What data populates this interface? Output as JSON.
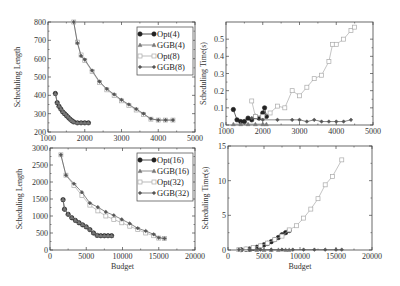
{
  "chart_data": [
    {
      "type": "line",
      "title": "",
      "xlabel": "",
      "ylabel": "Scheduling Length",
      "xlim": [
        1000,
        5000
      ],
      "ylim": [
        200,
        800
      ],
      "xticks": [
        1000,
        2000,
        3000,
        4000,
        5000
      ],
      "yticks": [
        200,
        300,
        400,
        500,
        600,
        700,
        800
      ],
      "legend": [
        "Opt(4)",
        "GGB(4)",
        "Opt(8)",
        "GGB(8)"
      ],
      "legend_position": "upper right",
      "series": [
        {
          "name": "Opt(4)",
          "x": [
            1200,
            1250,
            1300,
            1350,
            1400,
            1450,
            1500,
            1550,
            1600,
            1650,
            1700,
            1800,
            1900,
            2000,
            2100
          ],
          "y": [
            410,
            360,
            340,
            325,
            310,
            300,
            290,
            280,
            270,
            262,
            255,
            250,
            250,
            250,
            250
          ]
        },
        {
          "name": "GGB(4)",
          "x": [
            1200,
            1250,
            1300,
            1350,
            1400,
            1450,
            1500,
            1550,
            1600,
            1650,
            1700,
            1800,
            1900,
            2000,
            2100
          ],
          "y": [
            410,
            362,
            342,
            327,
            312,
            302,
            292,
            282,
            272,
            263,
            256,
            251,
            251,
            251,
            251
          ]
        },
        {
          "name": "Opt(8)",
          "x": [
            1700,
            1800,
            1900,
            2000,
            2200,
            2400,
            2600,
            2800,
            3000,
            3200,
            3400,
            3600,
            3800,
            4000,
            4200,
            4400
          ],
          "y": [
            800,
            690,
            620,
            590,
            530,
            470,
            430,
            400,
            370,
            345,
            320,
            295,
            270,
            265,
            265,
            265
          ]
        },
        {
          "name": "GGB(8)",
          "x": [
            1700,
            1800,
            1900,
            2000,
            2200,
            2400,
            2600,
            2800,
            3000,
            3200,
            3400,
            3600,
            3800,
            4000,
            4200,
            4400
          ],
          "y": [
            800,
            685,
            615,
            595,
            535,
            475,
            435,
            405,
            375,
            350,
            325,
            300,
            272,
            265,
            265,
            265
          ]
        }
      ]
    },
    {
      "type": "line",
      "title": "",
      "xlabel": "",
      "ylabel": "Scheduling Time(s)",
      "xlim": [
        1000,
        5000
      ],
      "ylim": [
        0,
        0.6
      ],
      "xticks": [
        1000,
        2000,
        3000,
        4000,
        5000
      ],
      "yticks": [
        0,
        0.1,
        0.2,
        0.3,
        0.4,
        0.5
      ],
      "series": [
        {
          "name": "Opt(4)",
          "x": [
            1200,
            1300,
            1400,
            1500,
            1600,
            1700,
            1800,
            1900,
            2000,
            2050,
            2100
          ],
          "y": [
            0.09,
            0.03,
            0.02,
            0.02,
            0.04,
            0.03,
            0.05,
            0.04,
            0.07,
            0.1,
            0.05
          ]
        },
        {
          "name": "GGB(4)",
          "x": [
            1200,
            1400,
            1600,
            1800,
            2000,
            2100
          ],
          "y": [
            0.005,
            0.005,
            0.005,
            0.005,
            0.005,
            0.005
          ]
        },
        {
          "name": "Opt(8)",
          "x": [
            1700,
            1800,
            2000,
            2200,
            2400,
            2600,
            2800,
            3000,
            3200,
            3400,
            3600,
            3800,
            3900,
            4000,
            4200,
            4400,
            4500
          ],
          "y": [
            0.14,
            0.05,
            0.05,
            0.07,
            0.11,
            0.1,
            0.2,
            0.17,
            0.22,
            0.27,
            0.29,
            0.37,
            0.47,
            0.47,
            0.5,
            0.55,
            0.57
          ]
        },
        {
          "name": "GGB(8)",
          "x": [
            1700,
            2000,
            2400,
            2800,
            3000,
            3200,
            3400,
            3600,
            3800,
            4000,
            4200,
            4400
          ],
          "y": [
            0.04,
            0.03,
            0.03,
            0.03,
            0.03,
            0.02,
            0.03,
            0.02,
            0.02,
            0.02,
            0.02,
            0.03
          ]
        }
      ]
    },
    {
      "type": "line",
      "title": "",
      "xlabel": "Budget",
      "ylabel": "Scheduling Length",
      "xlim": [
        0,
        20000
      ],
      "ylim": [
        0,
        3000
      ],
      "xticks": [
        0,
        5000,
        10000,
        15000,
        20000
      ],
      "yticks": [
        0,
        500,
        1000,
        1500,
        2000,
        2500,
        3000
      ],
      "legend": [
        "Opt(16)",
        "GGB(16)",
        "Opt(32)",
        "GGB(32)"
      ],
      "legend_position": "upper right",
      "series": [
        {
          "name": "Opt(16)",
          "x": [
            1800,
            2000,
            2500,
            3000,
            3500,
            4000,
            4500,
            5000,
            5500,
            6000,
            6500,
            7000,
            7500,
            8000,
            8500
          ],
          "y": [
            1480,
            1200,
            1050,
            950,
            870,
            800,
            740,
            680,
            600,
            500,
            430,
            420,
            420,
            420,
            420
          ]
        },
        {
          "name": "GGB(16)",
          "x": [
            1800,
            2000,
            2500,
            3000,
            3500,
            4000,
            4500,
            5000,
            5500,
            6000,
            6500,
            7000,
            7500,
            8000,
            8500
          ],
          "y": [
            1490,
            1210,
            1060,
            960,
            880,
            810,
            750,
            690,
            610,
            510,
            440,
            425,
            425,
            425,
            425
          ]
        },
        {
          "name": "Opt(32)",
          "x": [
            1500,
            2200,
            3300,
            4400,
            5500,
            6600,
            7700,
            8800,
            9900,
            11000,
            12100,
            13200,
            14300,
            15000,
            15800
          ],
          "y": [
            2800,
            2200,
            1900,
            1600,
            1320,
            1150,
            1000,
            900,
            800,
            700,
            600,
            500,
            420,
            350,
            340
          ]
        },
        {
          "name": "GGB(32)",
          "x": [
            1500,
            2200,
            3300,
            4400,
            5500,
            6600,
            7700,
            8800,
            9900,
            11000,
            12100,
            13200,
            14300,
            15000,
            15800
          ],
          "y": [
            2800,
            2200,
            1950,
            1700,
            1380,
            1260,
            1120,
            1020,
            900,
            780,
            640,
            560,
            460,
            360,
            340
          ]
        }
      ]
    },
    {
      "type": "line",
      "title": "",
      "xlabel": "Budget",
      "ylabel": "Scheduling Time(s)",
      "xlim": [
        0,
        20000
      ],
      "ylim": [
        0,
        15
      ],
      "xticks": [
        0,
        5000,
        10000,
        15000,
        20000
      ],
      "yticks": [
        0,
        5,
        10,
        15
      ],
      "series": [
        {
          "name": "Opt(16)",
          "x": [
            1800,
            2500,
            3000,
            3500,
            4000,
            4500,
            5000,
            5500,
            6000,
            6500,
            7000,
            7500,
            8000,
            8500
          ],
          "y": [
            0.05,
            0.1,
            0.15,
            0.25,
            0.4,
            0.55,
            0.75,
            0.95,
            1.2,
            1.5,
            1.8,
            2.2,
            2.5,
            2.8
          ]
        },
        {
          "name": "GGB(16)",
          "x": [
            1800,
            3000,
            4000,
            5000,
            6000,
            7000,
            8000,
            8500
          ],
          "y": [
            0.02,
            0.02,
            0.02,
            0.02,
            0.02,
            0.02,
            0.02,
            0.02
          ]
        },
        {
          "name": "Opt(32)",
          "x": [
            1500,
            2500,
            3500,
            4500,
            5500,
            6500,
            7500,
            8500,
            9500,
            10500,
            11500,
            12500,
            13500,
            14500,
            15800
          ],
          "y": [
            0.05,
            0.15,
            0.35,
            0.6,
            1.0,
            1.5,
            2.0,
            2.9,
            3.5,
            4.6,
            5.9,
            7.4,
            9.4,
            10.6,
            13.0
          ]
        },
        {
          "name": "GGB(32)",
          "x": [
            1500,
            3000,
            4500,
            6000,
            7500,
            9000,
            10500,
            12000,
            13500,
            15000,
            15800
          ],
          "y": [
            0.05,
            0.05,
            0.05,
            0.05,
            0.05,
            0.05,
            0.05,
            0.05,
            0.05,
            0.05,
            0.05
          ]
        }
      ]
    }
  ],
  "legends": {
    "top": [
      "Opt(4)",
      "GGB(4)",
      "Opt(8)",
      "GGB(8)"
    ],
    "bottom": [
      "Opt(16)",
      "GGB(16)",
      "Opt(32)",
      "GGB(32)"
    ]
  },
  "labels": {
    "ylabel_length": "Scheduling Length",
    "ylabel_time": "Scheduling Time(s)",
    "xlabel": "Budget"
  }
}
